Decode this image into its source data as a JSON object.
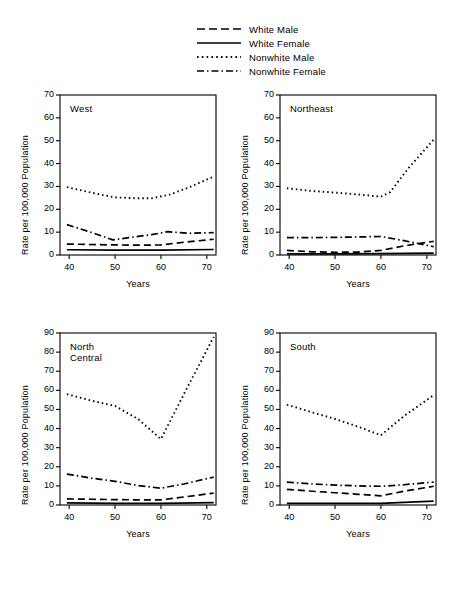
{
  "legend": {
    "items": [
      {
        "label": "White Male",
        "style": "dashed",
        "key": "white-male"
      },
      {
        "label": "White Female",
        "style": "solid",
        "key": "white-female"
      },
      {
        "label": "Nonwhite Male",
        "style": "dotted",
        "key": "nonwhite-male"
      },
      {
        "label": "Nonwhite Female",
        "style": "dash-dot",
        "key": "nonwhite-female"
      }
    ]
  },
  "axis": {
    "ylabel": "Rate per 100,000 Population",
    "xlabel": "Years",
    "xticks": [
      "40",
      "50",
      "60",
      "70"
    ],
    "yticks_70": [
      "0",
      "10",
      "20",
      "30",
      "40",
      "50",
      "60",
      "70"
    ],
    "yticks_90": [
      "0",
      "10",
      "20",
      "30",
      "40",
      "50",
      "60",
      "70",
      "80",
      "90"
    ]
  },
  "chart_data": [
    {
      "type": "line",
      "title": "West",
      "xlabel": "Years",
      "ylabel": "Rate per 100,000 Population",
      "x": [
        40,
        50,
        60,
        70
      ],
      "xlim": [
        38,
        72
      ],
      "ylim": [
        0,
        70
      ],
      "grid": false,
      "series": [
        {
          "name": "White Male",
          "style": "dashed",
          "x": [
            39.5,
            44,
            50,
            55,
            60,
            65,
            71.5
          ],
          "values": [
            4.8,
            4.6,
            4.4,
            4.3,
            4.4,
            5.6,
            6.9
          ]
        },
        {
          "name": "White Female",
          "style": "solid",
          "x": [
            39.5,
            50,
            60,
            71.5
          ],
          "values": [
            2.3,
            2.1,
            2.1,
            2.4
          ]
        },
        {
          "name": "Nonwhite Male",
          "style": "dotted",
          "x": [
            39.5,
            45,
            50,
            55,
            58,
            62,
            66,
            71.5
          ],
          "values": [
            29.7,
            27.2,
            25.2,
            24.8,
            24.8,
            26.5,
            29.5,
            34.3
          ]
        },
        {
          "name": "Nonwhite Female",
          "style": "dash-dot",
          "x": [
            39.5,
            45,
            49.5,
            53,
            58,
            61.5,
            66,
            71.5
          ],
          "values": [
            13.3,
            9.8,
            6.6,
            7.6,
            8.9,
            10.2,
            9.5,
            9.8
          ]
        }
      ]
    },
    {
      "type": "line",
      "title": "Northeast",
      "xlabel": "Years",
      "ylabel": "Rate per 100,000 Population",
      "x": [
        40,
        50,
        60,
        70
      ],
      "xlim": [
        38,
        72
      ],
      "ylim": [
        0,
        70
      ],
      "grid": false,
      "series": [
        {
          "name": "White Male",
          "style": "dashed",
          "x": [
            39.5,
            45,
            50,
            55,
            60,
            65,
            71.5
          ],
          "values": [
            2.0,
            1.4,
            1.2,
            1.3,
            2.0,
            4.0,
            6.0
          ]
        },
        {
          "name": "White Female",
          "style": "solid",
          "x": [
            39.5,
            50,
            60,
            71.5
          ],
          "values": [
            0.5,
            0.5,
            0.6,
            0.8
          ]
        },
        {
          "name": "Nonwhite Male",
          "style": "dotted",
          "x": [
            39.5,
            45,
            50,
            55,
            60,
            62,
            66,
            71.5
          ],
          "values": [
            29.2,
            28.0,
            27.3,
            26.5,
            25.5,
            27.5,
            38.0,
            50.5
          ]
        },
        {
          "name": "Nonwhite Female",
          "style": "dash-dot",
          "x": [
            39.5,
            45,
            50,
            55,
            60,
            65,
            71.5
          ],
          "values": [
            7.6,
            7.6,
            7.7,
            7.9,
            8.1,
            6.3,
            3.6
          ]
        }
      ]
    },
    {
      "type": "line",
      "title": "North Central",
      "xlabel": "Years",
      "ylabel": "Rate per 100,000 Population",
      "x": [
        40,
        50,
        60,
        70
      ],
      "xlim": [
        38,
        72
      ],
      "ylim": [
        0,
        90
      ],
      "grid": false,
      "series": [
        {
          "name": "White Male",
          "style": "dashed",
          "x": [
            39.5,
            45,
            50,
            55,
            60,
            65,
            71.5
          ],
          "values": [
            3.2,
            3.0,
            2.8,
            2.7,
            2.7,
            4.2,
            6.2
          ]
        },
        {
          "name": "White Female",
          "style": "solid",
          "x": [
            39.5,
            50,
            60,
            71.5
          ],
          "values": [
            1.1,
            0.9,
            0.8,
            1.2
          ]
        },
        {
          "name": "Nonwhite Male",
          "style": "dotted",
          "x": [
            39.5,
            45,
            50,
            55,
            60,
            65,
            71.5
          ],
          "values": [
            58.0,
            54.5,
            51.8,
            45.0,
            34.5,
            58.0,
            88.0
          ]
        },
        {
          "name": "Nonwhite Female",
          "style": "dash-dot",
          "x": [
            39.5,
            45,
            50,
            55,
            60,
            65,
            71.5
          ],
          "values": [
            16.2,
            14.0,
            12.4,
            10.2,
            8.8,
            11.0,
            14.6
          ]
        }
      ]
    },
    {
      "type": "line",
      "title": "South",
      "xlabel": "Years",
      "ylabel": "Rate per 100,000 Population",
      "x": [
        40,
        50,
        60,
        70
      ],
      "xlim": [
        38,
        72
      ],
      "ylim": [
        0,
        90
      ],
      "grid": false,
      "series": [
        {
          "name": "White Male",
          "style": "dashed",
          "x": [
            39.5,
            45,
            50,
            55,
            60,
            65,
            71.5
          ],
          "values": [
            8.2,
            7.2,
            6.4,
            5.6,
            4.8,
            7.2,
            9.8
          ]
        },
        {
          "name": "White Female",
          "style": "solid",
          "x": [
            39.5,
            50,
            60,
            65,
            71.5
          ],
          "values": [
            0.9,
            0.8,
            0.8,
            1.4,
            2.0
          ]
        },
        {
          "name": "Nonwhite Male",
          "style": "dotted",
          "x": [
            39.5,
            45,
            50,
            55,
            60,
            65,
            71.5
          ],
          "values": [
            52.5,
            48.5,
            45.0,
            41.0,
            36.5,
            46.5,
            57.5
          ]
        },
        {
          "name": "Nonwhite Female",
          "style": "dash-dot",
          "x": [
            39.5,
            45,
            50,
            55,
            60,
            65,
            71.5
          ],
          "values": [
            12.0,
            11.0,
            10.4,
            10.0,
            9.8,
            10.6,
            12.0
          ]
        }
      ]
    }
  ]
}
